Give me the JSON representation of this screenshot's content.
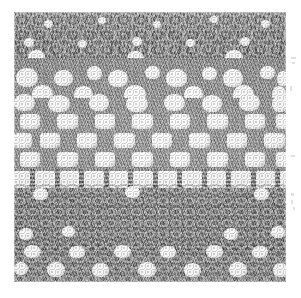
{
  "page": {
    "background_color": "#ffffff",
    "width": 301,
    "height": 298
  },
  "photo": {
    "caption": "Crochet lace sampler",
    "alt_text": "Grayscale scanned photograph of a crochet lace sampler showing horizontal pattern bands",
    "x": 14,
    "y": 12,
    "width": 272,
    "height": 270,
    "yarn_color": "#8f8f8f",
    "hole_color": "#ffffff",
    "shadow_color": "#5e5e5e",
    "bands": [
      {
        "name": "dense-textured-top",
        "label": "Dense textured crochet ground with scattered eyelets",
        "top": 0,
        "height": 46
      },
      {
        "name": "blob-row-upper",
        "label": "Row of rounded open petals",
        "top": 40,
        "height": 46
      },
      {
        "name": "blob-row-lower",
        "label": "Second row of rounded open petals",
        "top": 80,
        "height": 26
      },
      {
        "name": "filet-mesh",
        "label": "Filet mesh checkerboard squares",
        "top": 100,
        "height": 62
      },
      {
        "name": "ladder-bars",
        "label": "Ladder row of vertical bars",
        "top": 157,
        "height": 22
      },
      {
        "name": "scalloped-wave",
        "label": "Scalloped wave band of solid arches",
        "top": 172,
        "height": 66
      },
      {
        "name": "dotted-bottom",
        "label": "Dense ground with rows of round eyelets",
        "top": 232,
        "height": 38
      }
    ]
  },
  "margin_marks": {
    "label": "Faint bleed-through marks at right page margin",
    "color": "#c9c9c9",
    "items": [
      {
        "x": 291,
        "y": 57,
        "w": 5,
        "h": 2
      },
      {
        "x": 292,
        "y": 62,
        "w": 3,
        "h": 2
      },
      {
        "x": 290,
        "y": 86,
        "w": 2,
        "h": 5
      },
      {
        "x": 291,
        "y": 155,
        "w": 4,
        "h": 2
      },
      {
        "x": 291,
        "y": 193,
        "w": 3,
        "h": 3
      },
      {
        "x": 291,
        "y": 200,
        "w": 2,
        "h": 4
      },
      {
        "x": 293,
        "y": 207,
        "w": 2,
        "h": 3
      }
    ]
  }
}
